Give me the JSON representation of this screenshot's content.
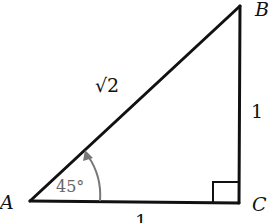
{
  "diagram": {
    "type": "right-triangle",
    "vertices": {
      "A": {
        "label": "A",
        "x": 30,
        "y": 201
      },
      "B": {
        "label": "B",
        "x": 240,
        "y": 6
      },
      "C": {
        "label": "C",
        "x": 239,
        "y": 203
      }
    },
    "sides": {
      "hypotenuse_AB": "√2",
      "leg_BC": "1",
      "leg_AC": "1"
    },
    "angle_A": "45°",
    "right_angle_at": "C",
    "colors": {
      "lines": "#111111",
      "angle_arc": "#777777"
    }
  }
}
